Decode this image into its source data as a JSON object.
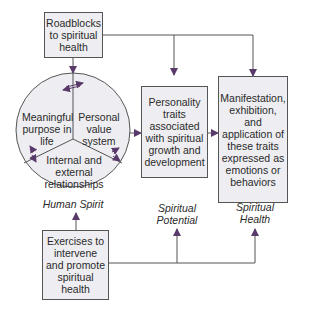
{
  "diagram": {
    "boxes": {
      "roadblocks": "Roadblocks to spiritual health",
      "personality": "Personality traits associated with spiritual growth and development",
      "manifestation": "Manifestation, exhibition, and application of these traits expressed as emotions or behaviors",
      "exercises": "Exercises to intervene and promote spiritual health"
    },
    "circle_sectors": {
      "meaningful": "Meaningful purpose in life",
      "personal": "Personal value system",
      "relationships": "Internal and external relationships"
    },
    "labels": {
      "human_spirit": "Human Spirit",
      "spiritual_potential": "Spiritual Potential",
      "spiritual_health": "Spiritual Health"
    },
    "colors": {
      "box_fill": "#eeeef2",
      "line": "#555555",
      "arrow": "#5a3a6a"
    }
  }
}
